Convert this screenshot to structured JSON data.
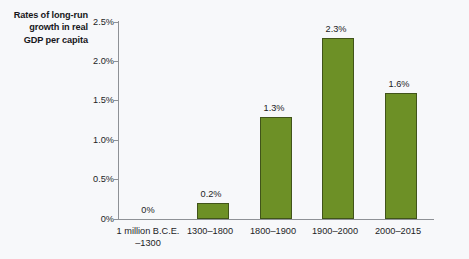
{
  "chart_data": {
    "type": "bar",
    "title": "Rates of long-run growth in real GDP per capita",
    "title_lines": [
      "Rates of long-run",
      "growth in real",
      "GDP per capita"
    ],
    "xlabel": "",
    "ylabel": "",
    "categories": [
      "1 million B.C.E. –1300",
      "1300–1800",
      "1800–1900",
      "1900–2000",
      "2000–2015"
    ],
    "category_lines": [
      [
        "1 million B.C.E.",
        "–1300"
      ],
      [
        "1300–1800",
        ""
      ],
      [
        "1800–1900",
        ""
      ],
      [
        "1900–2000",
        ""
      ],
      [
        "2000–2015",
        ""
      ]
    ],
    "values": [
      0,
      0.2,
      1.3,
      2.3,
      1.6
    ],
    "value_labels": [
      "0%",
      "0.2%",
      "1.3%",
      "2.3%",
      "1.6%"
    ],
    "ylim": [
      0,
      2.5
    ],
    "yticks": [
      0,
      0.5,
      1.0,
      1.5,
      2.0,
      2.5
    ],
    "ytick_labels": [
      "0%",
      "0.5%",
      "1.0%",
      "1.5%",
      "2.0%",
      "2.5%"
    ],
    "grid": false,
    "legend": null,
    "bar_color": "#6d9026",
    "bar_edge_color": "#41541a",
    "axis_color": "#8e9196",
    "text_color": "#1c1c1f",
    "background_color": "#f7f8fa"
  }
}
